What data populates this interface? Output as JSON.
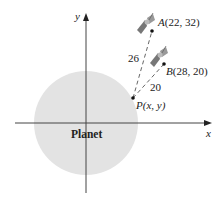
{
  "diagram": {
    "planet": {
      "label": "Planet",
      "fill": "#e3e3e3"
    },
    "axes": {
      "x_label": "x",
      "y_label": "y"
    },
    "points": {
      "A": {
        "name": "A",
        "coords": "(22, 32)"
      },
      "B": {
        "name": "B",
        "coords": "(28, 20)"
      },
      "P": {
        "name": "P",
        "coords": "(x, y)"
      }
    },
    "distances": {
      "PA": "26",
      "PB": "20"
    },
    "icons": [
      "satellite-icon",
      "satellite-icon"
    ]
  }
}
